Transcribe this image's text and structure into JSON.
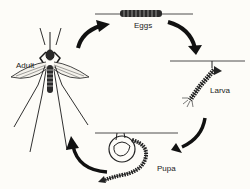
{
  "diagram": {
    "stages": [
      {
        "id": "eggs",
        "label": "Eggs"
      },
      {
        "id": "larva",
        "label": "Larva"
      },
      {
        "id": "pupa",
        "label": "Pupa"
      },
      {
        "id": "adult",
        "label": "Adult"
      }
    ],
    "flow": [
      "Eggs",
      "Larva",
      "Pupa",
      "Adult",
      "Eggs"
    ],
    "colors": {
      "ink": "#1a1a1a",
      "background": "#fdfcf8"
    }
  }
}
